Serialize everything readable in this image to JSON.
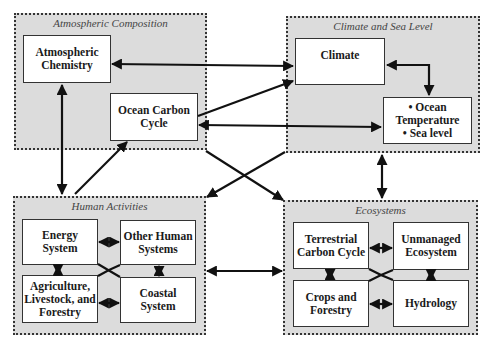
{
  "groups": {
    "atmospheric": {
      "title": "Atmospheric Composition",
      "boxes": [
        {
          "lines": [
            "Atmospheric",
            "Chemistry"
          ]
        },
        {
          "lines": [
            "Ocean Carbon",
            "Cycle"
          ]
        }
      ]
    },
    "climate": {
      "title": "Climate and Sea Level",
      "boxes": [
        {
          "lines": [
            "Climate"
          ]
        },
        {
          "lines": [
            "• Ocean",
            "Temperature",
            "• Sea level"
          ]
        }
      ]
    },
    "human": {
      "title": "Human Activities",
      "boxes": [
        {
          "lines": [
            "Energy",
            "System"
          ]
        },
        {
          "lines": [
            "Other Human",
            "Systems"
          ]
        },
        {
          "lines": [
            "Agriculture,",
            "Livestock, and",
            "Forestry"
          ]
        },
        {
          "lines": [
            "Coastal",
            "System"
          ]
        }
      ]
    },
    "ecosystems": {
      "title": "Ecosystems",
      "boxes": [
        {
          "lines": [
            "Terrestrial",
            "Carbon Cycle"
          ]
        },
        {
          "lines": [
            "Unmanaged",
            "Ecosystem"
          ]
        },
        {
          "lines": [
            "Crops and",
            "Forestry"
          ]
        },
        {
          "lines": [
            "Hydrology"
          ]
        }
      ]
    }
  },
  "colors": {
    "group_fill": "#dcdcdc",
    "box_fill": "#ffffff",
    "line": "#111111"
  }
}
